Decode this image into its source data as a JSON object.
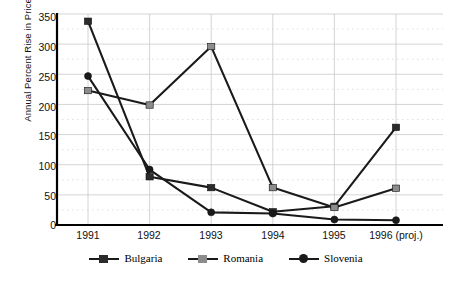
{
  "chart_data": {
    "type": "line",
    "title": "",
    "xlabel": "",
    "ylabel": "Annual Percent Rise in Prices",
    "categories": [
      "1991",
      "1992",
      "1993",
      "1994",
      "1995",
      "1996 (proj.)"
    ],
    "ylim": [
      0,
      350
    ],
    "yticks": [
      0,
      50,
      100,
      150,
      200,
      250,
      300,
      350
    ],
    "grid": true,
    "legend_position": "bottom",
    "series": [
      {
        "name": "Bulgaria",
        "marker": "square",
        "color": "#1a1a1a",
        "marker_color": "#2b2b2b",
        "values": [
          338,
          80,
          62,
          22,
          31,
          162
        ]
      },
      {
        "name": "Romania",
        "marker": "square",
        "color": "#1a1a1a",
        "marker_color": "#8c8c8c",
        "values": [
          223,
          199,
          296,
          62,
          29,
          61
        ]
      },
      {
        "name": "Slovenia",
        "marker": "circle",
        "color": "#1a1a1a",
        "marker_color": "#1a1a1a",
        "values": [
          247,
          92,
          21,
          19,
          9,
          8
        ]
      }
    ]
  },
  "axis": {
    "ytick_labels": [
      "350",
      "300",
      "250",
      "200",
      "150",
      "100",
      "50",
      "0"
    ],
    "xtick_labels": [
      "1991",
      "1992",
      "1993",
      "1994",
      "1995",
      "1996 (proj.)"
    ]
  },
  "legend": {
    "items": [
      {
        "label": "Bulgaria"
      },
      {
        "label": "Romania"
      },
      {
        "label": "Slovenia"
      }
    ]
  },
  "colors": {
    "line": "#1a1a1a",
    "grid_solid": "#c9c9c9",
    "grid_dotted": "#d8d8d8",
    "axis": "#000000",
    "bulgaria_marker": "#2b2b2b",
    "romania_marker": "#8c8c8c",
    "slovenia_marker": "#1a1a1a"
  }
}
